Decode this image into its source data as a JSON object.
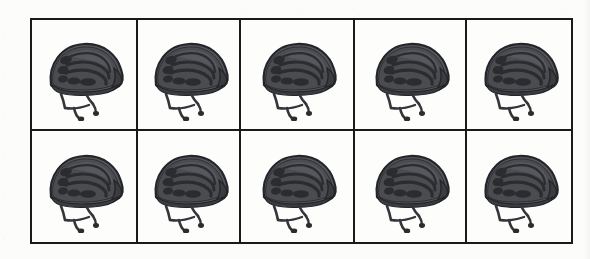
{
  "page": {
    "kind": "printed-worksheet-array",
    "background_color": "#fcfcfb"
  },
  "grid": {
    "name": "helmet-array",
    "rows": 2,
    "columns": 5,
    "total_items": 10,
    "border_color": "#1a1a1a",
    "border_width_px": 2,
    "cell_background": "#fdfdfc",
    "cells": [
      {
        "row": 1,
        "column": 1,
        "item": "bicycle-helmet"
      },
      {
        "row": 1,
        "column": 2,
        "item": "bicycle-helmet"
      },
      {
        "row": 1,
        "column": 3,
        "item": "bicycle-helmet"
      },
      {
        "row": 1,
        "column": 4,
        "item": "bicycle-helmet"
      },
      {
        "row": 1,
        "column": 5,
        "item": "bicycle-helmet"
      },
      {
        "row": 2,
        "column": 1,
        "item": "bicycle-helmet"
      },
      {
        "row": 2,
        "column": 2,
        "item": "bicycle-helmet"
      },
      {
        "row": 2,
        "column": 3,
        "item": "bicycle-helmet"
      },
      {
        "row": 2,
        "column": 4,
        "item": "bicycle-helmet"
      },
      {
        "row": 2,
        "column": 5,
        "item": "bicycle-helmet"
      }
    ]
  },
  "item": {
    "icon_name": "bicycle-helmet-icon",
    "label": "bicycle helmet",
    "orientation": "side view facing right",
    "shell_color": "#55565a",
    "shell_dark_color": "#3b3c40",
    "vent_color": "#2b2c30",
    "outline_color": "#24252a",
    "strap_color": "#34353a",
    "highlight_color": "#6e7075",
    "vent_rows": 4
  }
}
